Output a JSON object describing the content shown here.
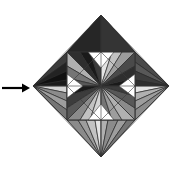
{
  "figure": {
    "title": "Stellated octahedron wireframe render with pointer arrow",
    "canvas": {
      "width": 183,
      "height": 169,
      "background": "#ffffff"
    },
    "annotation": {
      "arrow": {
        "name": "pointer-arrow",
        "direction": "right",
        "color": "#000000",
        "shaft_start_x": 2,
        "shaft_end_x": 22,
        "y": 88,
        "head_tip_x": 30,
        "head_half_height": 4.5,
        "stroke_width": 2.2
      }
    },
    "solid": {
      "name": "stellated-octahedron",
      "center_x": 101,
      "center_y": 86,
      "radius_x": 68,
      "radius_y": 71,
      "inner_square_half": 34,
      "outline_color": "#2b2b2b",
      "outline_width": 0.7,
      "palette": {
        "near_black": "#1a1a1a",
        "black": "#111111",
        "dark_1": "#2e2e2e",
        "dark_2": "#3c3c3c",
        "dark_3": "#4a4a4a",
        "mid_1": "#585858",
        "mid_2": "#676767",
        "mid_3": "#757575",
        "light_1": "#8b8b8b",
        "light_2": "#9d9d9d",
        "light_3": "#b0b0b0",
        "light_4": "#c2c2c2",
        "pale_1": "#d4d4d4",
        "pale_2": "#e4e4e4",
        "white": "#ffffff"
      }
    },
    "facets": {
      "top_corner": [
        {
          "name": "facet-top-a",
          "points": "101,15 67,52 78,52",
          "fill": "#2e2e2e"
        },
        {
          "name": "facet-top-b",
          "points": "101,15 78,52 86,52",
          "fill": "#1a1a1a"
        },
        {
          "name": "facet-top-c",
          "points": "101,15 86,52 95,52",
          "fill": "#3c3c3c"
        },
        {
          "name": "facet-top-d",
          "points": "101,15 95,52 101,52",
          "fill": "#111111"
        },
        {
          "name": "facet-top-e",
          "points": "101,15 101,52 108,52",
          "fill": "#2e2e2e"
        },
        {
          "name": "facet-top-f",
          "points": "101,15 108,52 118,52",
          "fill": "#4a4a4a"
        },
        {
          "name": "facet-top-g",
          "points": "101,15 118,52 127,52",
          "fill": "#3c3c3c"
        },
        {
          "name": "facet-top-h",
          "points": "101,15 127,52 135,52",
          "fill": "#585858"
        },
        {
          "name": "facet-top-ridge-left",
          "points": "101,15 67,52 101,52",
          "fill": "#262626"
        },
        {
          "name": "facet-top-ridge-right",
          "points": "101,15 101,52 135,52",
          "fill": "#343434"
        }
      ],
      "left_corner": [
        {
          "name": "facet-left-a",
          "points": "33,86 67,52 67,62",
          "fill": "#3c3c3c"
        },
        {
          "name": "facet-left-b",
          "points": "33,86 67,62 67,71",
          "fill": "#232323"
        },
        {
          "name": "facet-left-c",
          "points": "33,86 67,71 67,80",
          "fill": "#111111"
        },
        {
          "name": "facet-left-d",
          "points": "33,86 67,80 67,86",
          "fill": "#1a1a1a"
        },
        {
          "name": "facet-left-e",
          "points": "33,86 67,86 67,93",
          "fill": "#d4d4d4"
        },
        {
          "name": "facet-left-f",
          "points": "33,86 67,93 67,101",
          "fill": "#8b8b8b"
        },
        {
          "name": "facet-left-g",
          "points": "33,86 67,101 67,110",
          "fill": "#9d9d9d"
        },
        {
          "name": "facet-left-h",
          "points": "33,86 67,110 67,120",
          "fill": "#757575"
        }
      ],
      "right_corner": [
        {
          "name": "facet-right-a",
          "points": "169,86 135,52 135,62",
          "fill": "#4a4a4a"
        },
        {
          "name": "facet-right-b",
          "points": "169,86 135,62 135,71",
          "fill": "#585858"
        },
        {
          "name": "facet-right-c",
          "points": "169,86 135,71 135,80",
          "fill": "#3c3c3c"
        },
        {
          "name": "facet-right-d",
          "points": "169,86 135,80 135,86",
          "fill": "#2e2e2e"
        },
        {
          "name": "facet-right-e",
          "points": "169,86 135,86 135,93",
          "fill": "#e4e4e4"
        },
        {
          "name": "facet-right-f",
          "points": "169,86 135,93 135,101",
          "fill": "#b0b0b0"
        },
        {
          "name": "facet-right-g",
          "points": "169,86 135,101 135,110",
          "fill": "#9d9d9d"
        },
        {
          "name": "facet-right-h",
          "points": "169,86 135,110 135,120",
          "fill": "#8b8b8b"
        }
      ],
      "bottom_corner": [
        {
          "name": "facet-bottom-a",
          "points": "101,157 67,120 78,120",
          "fill": "#8b8b8b"
        },
        {
          "name": "facet-bottom-b",
          "points": "101,157 78,120 86,120",
          "fill": "#9d9d9d"
        },
        {
          "name": "facet-bottom-c",
          "points": "101,157 86,120 95,120",
          "fill": "#c2c2c2"
        },
        {
          "name": "facet-bottom-d",
          "points": "101,157 95,120 101,120",
          "fill": "#e4e4e4"
        },
        {
          "name": "facet-bottom-e",
          "points": "101,157 101,120 108,120",
          "fill": "#b0b0b0"
        },
        {
          "name": "facet-bottom-f",
          "points": "101,157 108,120 118,120",
          "fill": "#8b8b8b"
        },
        {
          "name": "facet-bottom-g",
          "points": "101,157 118,120 127,120",
          "fill": "#9d9d9d"
        },
        {
          "name": "facet-bottom-h",
          "points": "101,157 127,120 135,120",
          "fill": "#757575"
        }
      ],
      "quadrant_tl": [
        {
          "name": "facet-tl-1",
          "points": "101,86 67,52 67,66",
          "fill": "#9d9d9d"
        },
        {
          "name": "facet-tl-2",
          "points": "101,86 67,66 67,52",
          "fill": "#b0b0b0"
        },
        {
          "name": "facet-tl-3",
          "points": "101,86 67,52 80,52",
          "fill": "#2e2e2e"
        },
        {
          "name": "facet-tl-4",
          "points": "101,86 80,52 90,52",
          "fill": "#1a1a1a"
        },
        {
          "name": "facet-tl-5",
          "points": "101,86 90,52 101,52",
          "fill": "#3c3c3c"
        },
        {
          "name": "facet-tl-6",
          "points": "101,86 67,66 67,78",
          "fill": "#757575"
        },
        {
          "name": "facet-tl-7",
          "points": "101,86 67,78 67,86",
          "fill": "#585858"
        }
      ],
      "quadrant_tr": [
        {
          "name": "facet-tr-1",
          "points": "101,86 101,52 112,52",
          "fill": "#e4e4e4"
        },
        {
          "name": "facet-tr-2",
          "points": "101,86 112,52 122,52",
          "fill": "#c2c2c2"
        },
        {
          "name": "facet-tr-3",
          "points": "101,86 122,52 135,52",
          "fill": "#9d9d9d"
        },
        {
          "name": "facet-tr-4",
          "points": "101,86 135,52 135,66",
          "fill": "#4a4a4a"
        },
        {
          "name": "facet-tr-5",
          "points": "101,86 135,66 135,78",
          "fill": "#2e2e2e"
        },
        {
          "name": "facet-tr-6",
          "points": "101,86 135,78 135,86",
          "fill": "#1a1a1a"
        }
      ],
      "quadrant_bl": [
        {
          "name": "facet-bl-1",
          "points": "101,86 67,86 67,96",
          "fill": "#1a1a1a"
        },
        {
          "name": "facet-bl-2",
          "points": "101,86 67,96 67,108",
          "fill": "#3c3c3c"
        },
        {
          "name": "facet-bl-3",
          "points": "101,86 67,108 67,120",
          "fill": "#585858"
        },
        {
          "name": "facet-bl-4",
          "points": "101,86 67,120 80,120",
          "fill": "#8b8b8b"
        },
        {
          "name": "facet-bl-5",
          "points": "101,86 80,120 90,120",
          "fill": "#c2c2c2"
        },
        {
          "name": "facet-bl-6",
          "points": "101,86 90,120 101,120",
          "fill": "#d4d4d4"
        }
      ],
      "quadrant_br": [
        {
          "name": "facet-br-1",
          "points": "101,86 101,120 112,120",
          "fill": "#757575"
        },
        {
          "name": "facet-br-2",
          "points": "101,86 112,120 122,120",
          "fill": "#9d9d9d"
        },
        {
          "name": "facet-br-3",
          "points": "101,86 122,120 135,120",
          "fill": "#b0b0b0"
        },
        {
          "name": "facet-br-4",
          "points": "101,86 135,120 135,108",
          "fill": "#8b8b8b"
        },
        {
          "name": "facet-br-5",
          "points": "101,86 135,108 135,96",
          "fill": "#585858"
        },
        {
          "name": "facet-br-6",
          "points": "101,86 135,96 135,86",
          "fill": "#3c3c3c"
        }
      ],
      "spikes": [
        {
          "name": "spike-top-left-dark",
          "points": "101,15 67,52 101,52",
          "fill": "#1f1f1f"
        },
        {
          "name": "spike-top-right-dark",
          "points": "101,15 101,52 135,52",
          "fill": "#343434"
        },
        {
          "name": "spike-left-upper-dark",
          "points": "33,86 67,52 67,86",
          "fill": "#1a1a1a"
        },
        {
          "name": "spike-left-lower-light",
          "points": "33,86 67,86 67,120",
          "fill": "#a8a8a8"
        },
        {
          "name": "spike-right-upper-dark",
          "points": "169,86 135,52 135,86",
          "fill": "#3c3c3c"
        },
        {
          "name": "spike-right-lower-light",
          "points": "169,86 135,86 135,120",
          "fill": "#b0b0b0"
        },
        {
          "name": "spike-bottom-left-light",
          "points": "101,157 67,120 101,120",
          "fill": "#9d9d9d"
        },
        {
          "name": "spike-bottom-right-light",
          "points": "101,157 101,120 135,120",
          "fill": "#8b8b8b"
        }
      ],
      "white_notches": [
        {
          "name": "notch-top",
          "points": "101,52 88,52 101,68 114,52",
          "fill": "#ffffff"
        },
        {
          "name": "notch-left",
          "points": "67,86 67,74 83,86 67,98",
          "fill": "#ffffff"
        },
        {
          "name": "notch-right",
          "points": "135,86 135,74 119,86 135,98",
          "fill": "#ffffff"
        },
        {
          "name": "notch-bottom",
          "points": "101,120 88,120 101,104 114,120",
          "fill": "#ffffff"
        }
      ]
    },
    "edges": {
      "name": "wireframe-edges",
      "color": "#3a3a3a",
      "width": 0.6,
      "lines": [
        "101,15 33,86",
        "33,86 101,157",
        "101,157 169,86",
        "169,86 101,15",
        "67,52 135,52",
        "135,52 135,120",
        "135,120 67,120",
        "67,120 67,52",
        "101,15 101,157",
        "33,86 169,86",
        "67,52 135,120",
        "135,52 67,120",
        "101,52 67,86",
        "101,52 135,86",
        "101,120 67,86",
        "101,120 135,86"
      ]
    }
  }
}
